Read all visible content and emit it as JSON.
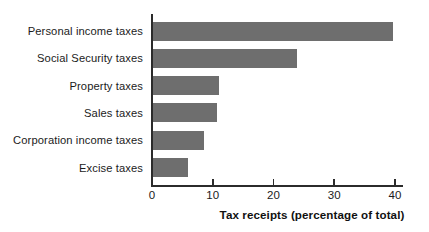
{
  "chart_data": {
    "type": "bar",
    "orientation": "horizontal",
    "title": "",
    "subtitle": "",
    "xlabel": "Tax receipts (percentage of total)",
    "ylabel": "",
    "categories": [
      "Personal income taxes",
      "Social Security taxes",
      "Property taxes",
      "Sales taxes",
      "Corporation income taxes",
      "Excise taxes"
    ],
    "values": [
      39.6,
      23.8,
      11.0,
      10.7,
      8.5,
      6.0
    ],
    "xlim": [
      0,
      40
    ],
    "xticks": [
      0,
      10,
      20,
      30,
      40
    ],
    "xtick_labels": [
      "0",
      "10",
      "20",
      "30",
      "40"
    ],
    "grid": false,
    "legend": false,
    "bar_color": "#6e6e6e",
    "axis_color": "#2b2b2b",
    "background_color": "#ffffff"
  }
}
